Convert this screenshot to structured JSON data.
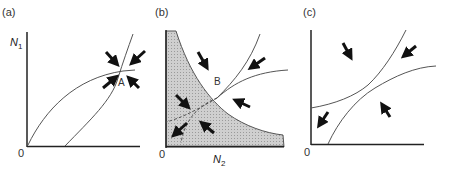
{
  "panels": [
    {
      "id": "a",
      "label": "(a)",
      "origin": "0",
      "y_axis": "N",
      "y_sub": "1",
      "point": "A"
    },
    {
      "id": "b",
      "label": "(b)",
      "origin": "0",
      "x_axis": "N",
      "x_sub": "2",
      "point": "B"
    },
    {
      "id": "c",
      "label": "(c)",
      "origin": "0"
    }
  ],
  "colors": {
    "axis": "#222222",
    "curve": "#555555",
    "arrow": "#111111",
    "shade": "#c8c8c8"
  }
}
